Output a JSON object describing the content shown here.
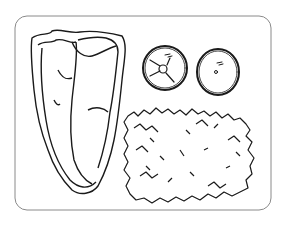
{
  "illustration": {
    "subject": "coloring page of a dinner plate",
    "items": [
      {
        "name": "t-bone steak"
      },
      {
        "name": "tomato slice"
      },
      {
        "name": "orange"
      },
      {
        "name": "rice / hash brown patty"
      }
    ],
    "colors": {
      "line": "#1a1a1a",
      "background": "#ffffff",
      "tray_border": "#8a8a8a"
    }
  }
}
